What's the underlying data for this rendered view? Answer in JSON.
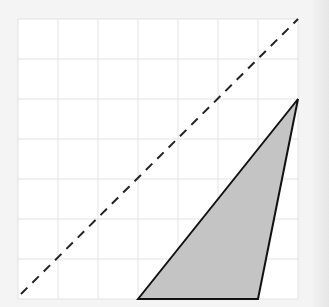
{
  "diagram": {
    "type": "grid-geometry",
    "grid": {
      "cols": 7,
      "rows": 7,
      "cell_px": 40,
      "origin_px": [
        18,
        19
      ],
      "line_color": "#e2e2e2",
      "background": "#ffffff"
    },
    "dashed_line": {
      "from": [
        0,
        0
      ],
      "to": [
        7,
        7
      ],
      "color": "#222222",
      "style": "dashed"
    },
    "triangle": {
      "vertices_grid": [
        [
          3,
          0
        ],
        [
          7,
          5
        ],
        [
          6,
          0
        ]
      ],
      "fill": "#c4c4c4",
      "stroke": "#111111"
    }
  }
}
